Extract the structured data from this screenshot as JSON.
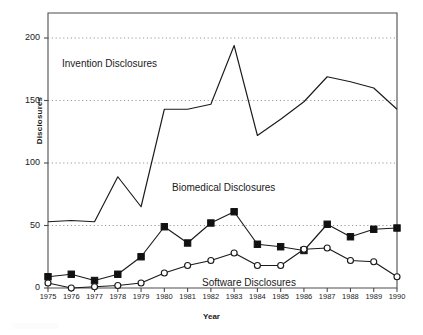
{
  "chart_data": {
    "type": "line",
    "title": "",
    "xlabel": "Year",
    "ylabel": "Disclosures",
    "x": [
      1975,
      1976,
      1977,
      1978,
      1979,
      1980,
      1981,
      1982,
      1983,
      1984,
      1985,
      1986,
      1987,
      1988,
      1989,
      1990
    ],
    "xlim": [
      1975,
      1990
    ],
    "ylim": [
      0,
      220
    ],
    "yticks": [
      0,
      50,
      100,
      150,
      200
    ],
    "xticks": [
      "1975",
      "1976",
      "1977",
      "1978",
      "1979",
      "1980",
      "1981",
      "1982",
      "1983",
      "1984",
      "1985",
      "1986",
      "1987",
      "1988",
      "1989",
      "1990"
    ],
    "grid": "horizontal-dotted",
    "legend": "inline-annotations",
    "series": [
      {
        "name": "Invention Disclosures",
        "marker": "none",
        "values": [
          53,
          54,
          53,
          89,
          65,
          143,
          143,
          147,
          194,
          122,
          135,
          149,
          169,
          165,
          160,
          143
        ]
      },
      {
        "name": "Biomedical Disclosures",
        "marker": "filled-square",
        "values": [
          9,
          11,
          6,
          11,
          25,
          49,
          36,
          52,
          61,
          35,
          33,
          30,
          51,
          41,
          47,
          48
        ]
      },
      {
        "name": "Software Disclosures",
        "marker": "open-circle",
        "values": [
          4,
          0,
          1,
          2,
          4,
          12,
          18,
          22,
          28,
          18,
          18,
          31,
          32,
          22,
          21,
          9
        ]
      }
    ],
    "annotations": [
      {
        "id": "invention",
        "text": "Invention Disclosures"
      },
      {
        "id": "biomedical",
        "text": "Biomedical Disclosures"
      },
      {
        "id": "software",
        "text": "Software Disclosures"
      }
    ],
    "colors": {
      "line": "#1a1a1a",
      "grid": "#9a9a9a",
      "frame": "#4d4d4d",
      "marker_fill": "#111111",
      "marker_open_fill": "#ffffff"
    }
  }
}
